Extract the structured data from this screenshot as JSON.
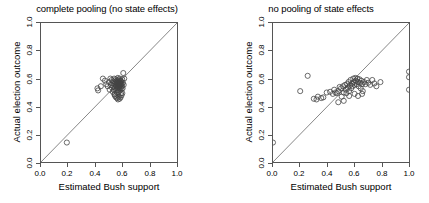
{
  "figure": {
    "background": "#ffffff",
    "axis_color": "#555555",
    "point_color": "#444444",
    "line_color": "#666666"
  },
  "chart_data": [
    {
      "type": "scatter",
      "title": "complete pooling (no state effects)",
      "xlabel": "Estimated Bush support",
      "ylabel": "Actual election outcome",
      "xlim": [
        0.0,
        1.0
      ],
      "ylim": [
        0.0,
        1.0
      ],
      "xticks": [
        "0.0",
        "0.2",
        "0.4",
        "0.6",
        "0.8",
        "1.0"
      ],
      "yticks": [
        "0.0",
        "0.2",
        "0.4",
        "0.6",
        "0.8",
        "1.0"
      ],
      "grid": false,
      "legend": "none",
      "annotations": [
        "identity line y = x"
      ],
      "reference_line": {
        "type": "identity",
        "x0": 0.0,
        "y0": 0.0,
        "x1": 1.0,
        "y1": 1.0
      },
      "marker": {
        "shape": "open-circle",
        "radius_px": 2.6
      },
      "points": [
        [
          0.19,
          0.14
        ],
        [
          0.415,
          0.53
        ],
        [
          0.42,
          0.515
        ],
        [
          0.44,
          0.545
        ],
        [
          0.455,
          0.6
        ],
        [
          0.47,
          0.585
        ],
        [
          0.48,
          0.56
        ],
        [
          0.49,
          0.545
        ],
        [
          0.5,
          0.575
        ],
        [
          0.505,
          0.52
        ],
        [
          0.51,
          0.6
        ],
        [
          0.515,
          0.555
        ],
        [
          0.52,
          0.59
        ],
        [
          0.522,
          0.535
        ],
        [
          0.525,
          0.565
        ],
        [
          0.528,
          0.505
        ],
        [
          0.53,
          0.58
        ],
        [
          0.533,
          0.545
        ],
        [
          0.535,
          0.52
        ],
        [
          0.538,
          0.6
        ],
        [
          0.54,
          0.56
        ],
        [
          0.542,
          0.49
        ],
        [
          0.545,
          0.575
        ],
        [
          0.546,
          0.535
        ],
        [
          0.548,
          0.555
        ],
        [
          0.55,
          0.595
        ],
        [
          0.552,
          0.515
        ],
        [
          0.554,
          0.57
        ],
        [
          0.555,
          0.545
        ],
        [
          0.557,
          0.585
        ],
        [
          0.558,
          0.5
        ],
        [
          0.56,
          0.56
        ],
        [
          0.561,
          0.53
        ],
        [
          0.563,
          0.575
        ],
        [
          0.564,
          0.55
        ],
        [
          0.565,
          0.605
        ],
        [
          0.566,
          0.52
        ],
        [
          0.568,
          0.565
        ],
        [
          0.569,
          0.54
        ],
        [
          0.57,
          0.59
        ],
        [
          0.571,
          0.505
        ],
        [
          0.573,
          0.555
        ],
        [
          0.574,
          0.58
        ],
        [
          0.575,
          0.53
        ],
        [
          0.576,
          0.56
        ],
        [
          0.578,
          0.545
        ],
        [
          0.579,
          0.6
        ],
        [
          0.58,
          0.515
        ],
        [
          0.581,
          0.57
        ],
        [
          0.583,
          0.55
        ],
        [
          0.584,
          0.585
        ],
        [
          0.585,
          0.535
        ],
        [
          0.586,
          0.565
        ],
        [
          0.588,
          0.495
        ],
        [
          0.589,
          0.555
        ],
        [
          0.59,
          0.58
        ],
        [
          0.592,
          0.525
        ],
        [
          0.594,
          0.56
        ],
        [
          0.595,
          0.545
        ],
        [
          0.597,
          0.595
        ],
        [
          0.6,
          0.53
        ],
        [
          0.602,
          0.57
        ],
        [
          0.605,
          0.64
        ],
        [
          0.608,
          0.555
        ],
        [
          0.612,
          0.6
        ],
        [
          0.56,
          0.46
        ],
        [
          0.566,
          0.45
        ],
        [
          0.572,
          0.47
        ],
        [
          0.578,
          0.455
        ],
        [
          0.585,
          0.465
        ],
        [
          0.545,
          0.475
        ],
        [
          0.552,
          0.465
        ],
        [
          0.54,
          0.485
        ],
        [
          0.592,
          0.48
        ],
        [
          0.598,
          0.495
        ]
      ]
    },
    {
      "type": "scatter",
      "title": "no pooling of state effects",
      "xlabel": "Estimated Bush support",
      "ylabel": "Actual election outcome",
      "xlim": [
        0.0,
        1.0
      ],
      "ylim": [
        0.0,
        1.0
      ],
      "xticks": [
        "0.0",
        "0.2",
        "0.4",
        "0.6",
        "0.8",
        "1.0"
      ],
      "yticks": [
        "0.0",
        "0.2",
        "0.4",
        "0.6",
        "0.8",
        "1.0"
      ],
      "grid": false,
      "legend": "none",
      "annotations": [
        "identity line y = x"
      ],
      "reference_line": {
        "type": "identity",
        "x0": 0.0,
        "y0": 0.0,
        "x1": 1.0,
        "y1": 1.0
      },
      "marker": {
        "shape": "open-circle",
        "radius_px": 2.6
      },
      "points": [
        [
          0.0,
          0.14
        ],
        [
          0.2,
          0.51
        ],
        [
          0.255,
          0.62
        ],
        [
          0.3,
          0.455
        ],
        [
          0.32,
          0.45
        ],
        [
          0.33,
          0.47
        ],
        [
          0.355,
          0.46
        ],
        [
          0.37,
          0.465
        ],
        [
          0.395,
          0.5
        ],
        [
          0.42,
          0.505
        ],
        [
          0.44,
          0.49
        ],
        [
          0.45,
          0.52
        ],
        [
          0.46,
          0.5
        ],
        [
          0.47,
          0.495
        ],
        [
          0.48,
          0.51
        ],
        [
          0.49,
          0.54
        ],
        [
          0.5,
          0.53
        ],
        [
          0.505,
          0.47
        ],
        [
          0.515,
          0.545
        ],
        [
          0.52,
          0.5
        ],
        [
          0.53,
          0.555
        ],
        [
          0.535,
          0.52
        ],
        [
          0.54,
          0.495
        ],
        [
          0.545,
          0.56
        ],
        [
          0.55,
          0.535
        ],
        [
          0.555,
          0.575
        ],
        [
          0.56,
          0.51
        ],
        [
          0.565,
          0.55
        ],
        [
          0.57,
          0.59
        ],
        [
          0.575,
          0.53
        ],
        [
          0.58,
          0.565
        ],
        [
          0.585,
          0.545
        ],
        [
          0.59,
          0.6
        ],
        [
          0.595,
          0.575
        ],
        [
          0.6,
          0.555
        ],
        [
          0.605,
          0.605
        ],
        [
          0.61,
          0.585
        ],
        [
          0.615,
          0.56
        ],
        [
          0.62,
          0.6
        ],
        [
          0.625,
          0.575
        ],
        [
          0.63,
          0.545
        ],
        [
          0.635,
          0.595
        ],
        [
          0.64,
          0.57
        ],
        [
          0.645,
          0.53
        ],
        [
          0.65,
          0.585
        ],
        [
          0.655,
          0.56
        ],
        [
          0.66,
          0.51
        ],
        [
          0.67,
          0.575
        ],
        [
          0.68,
          0.56
        ],
        [
          0.69,
          0.59
        ],
        [
          0.7,
          0.57
        ],
        [
          0.715,
          0.555
        ],
        [
          0.73,
          0.59
        ],
        [
          0.745,
          0.565
        ],
        [
          0.76,
          0.545
        ],
        [
          0.79,
          0.575
        ],
        [
          0.48,
          0.43
        ],
        [
          0.52,
          0.44
        ],
        [
          0.56,
          0.475
        ],
        [
          0.6,
          0.49
        ],
        [
          0.625,
          0.475
        ],
        [
          0.655,
          0.49
        ],
        [
          1.0,
          0.65
        ],
        [
          1.0,
          0.61
        ],
        [
          1.0,
          0.52
        ]
      ]
    }
  ]
}
